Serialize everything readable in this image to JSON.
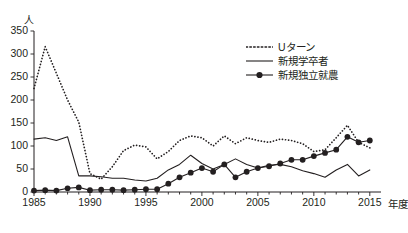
{
  "chart_data": {
    "type": "line",
    "title": "",
    "subtitle": "",
    "xlabel": "年度",
    "ylabel": "人",
    "xlim": [
      1985,
      2016
    ],
    "ylim": [
      0,
      350
    ],
    "grid": false,
    "legend_position": "top-right",
    "x": [
      1985,
      1986,
      1987,
      1988,
      1989,
      1990,
      1991,
      1992,
      1993,
      1994,
      1995,
      1996,
      1997,
      1998,
      1999,
      2000,
      2001,
      2002,
      2003,
      2004,
      2005,
      2006,
      2007,
      2008,
      2009,
      2010,
      2011,
      2012,
      2013,
      2014,
      2015
    ],
    "xticks": [
      1985,
      1990,
      1995,
      2000,
      2005,
      2010,
      2015
    ],
    "xtick_labels": [
      "1985",
      "1990",
      "1995",
      "2000",
      "2005",
      "2010",
      "2015"
    ],
    "yticks": [
      0,
      50,
      100,
      150,
      200,
      250,
      300,
      350
    ],
    "ytick_labels": [
      "0",
      "50",
      "100",
      "150",
      "200",
      "250",
      "300",
      "350"
    ],
    "series": [
      {
        "name": "Uターン",
        "style": "dotted",
        "marker": "none",
        "color": "#231f20",
        "values": [
          225,
          316,
          258,
          200,
          152,
          40,
          28,
          55,
          90,
          102,
          98,
          72,
          88,
          112,
          122,
          118,
          100,
          122,
          105,
          118,
          112,
          108,
          115,
          112,
          105,
          88,
          92,
          118,
          145,
          108,
          96
        ]
      },
      {
        "name": "新規学卒者",
        "style": "solid",
        "marker": "none",
        "color": "#231f20",
        "values": [
          115,
          118,
          112,
          120,
          35,
          35,
          33,
          30,
          30,
          26,
          24,
          30,
          48,
          60,
          80,
          62,
          50,
          60,
          72,
          60,
          52,
          58,
          60,
          55,
          46,
          40,
          32,
          48,
          60,
          35,
          48
        ]
      },
      {
        "name": "新規独立就農",
        "style": "solid-marker",
        "marker": "circle",
        "color": "#231f20",
        "values": [
          3,
          4,
          3,
          8,
          10,
          4,
          5,
          5,
          4,
          5,
          6,
          6,
          18,
          32,
          42,
          52,
          44,
          60,
          32,
          44,
          52,
          56,
          62,
          70,
          70,
          78,
          85,
          92,
          120,
          108,
          112
        ]
      }
    ]
  },
  "axis": {
    "y_unit": "人",
    "x_unit": "年度"
  },
  "legend": {
    "items": [
      {
        "label": "Uターン",
        "symbol": "dotted-line"
      },
      {
        "label": "新規学卒者",
        "symbol": "solid-line"
      },
      {
        "label": "新規独立就農",
        "symbol": "solid-line-with-marker"
      }
    ]
  }
}
